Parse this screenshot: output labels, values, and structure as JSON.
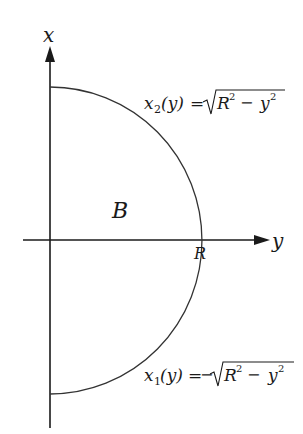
{
  "diagram": {
    "type": "semicircle-region",
    "axes": {
      "vertical_label": "x",
      "horizontal_label": "y"
    },
    "region_label": "B",
    "radius_label": "R",
    "curves": {
      "upper": {
        "lhs_var": "x",
        "lhs_sub": "2",
        "lhs_arg": "(y)",
        "equals": "=",
        "sign": "",
        "rad_R": "R",
        "rad_R_exp": "2",
        "minus": "−",
        "rad_y": "y",
        "rad_y_exp": "2"
      },
      "lower": {
        "lhs_var": "x",
        "lhs_sub": "1",
        "lhs_arg": "(y)",
        "equals": "=",
        "sign": "−",
        "rad_R": "R",
        "rad_R_exp": "2",
        "minus": "−",
        "rad_y": "y",
        "rad_y_exp": "2"
      }
    },
    "colors": {
      "axis": "#1a1a1a",
      "curve": "#333333",
      "background": "#ffffff"
    }
  }
}
